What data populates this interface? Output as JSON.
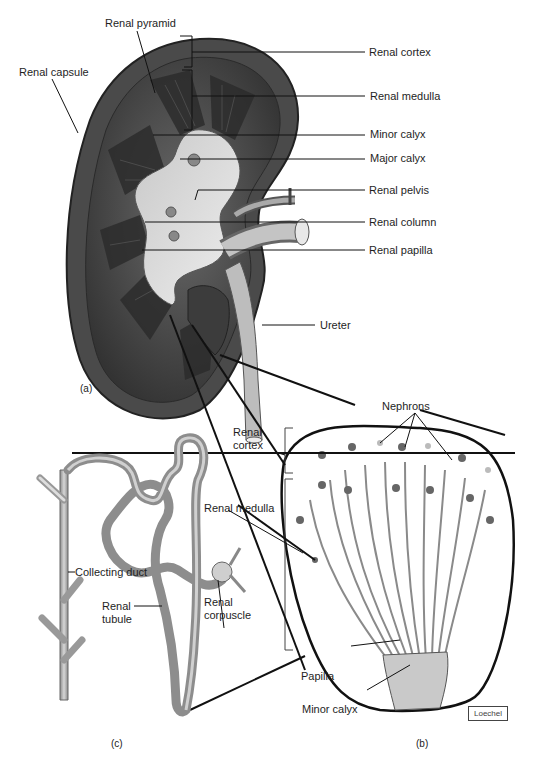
{
  "figure": {
    "panels": {
      "a": "(a)",
      "b": "(b)",
      "c": "(c)"
    },
    "signature": "Loechel"
  },
  "panel_a": {
    "labels": {
      "renal_pyramid": "Renal pyramid",
      "renal_capsule": "Renal capsule",
      "renal_cortex": "Renal cortex",
      "renal_medulla": "Renal medulla",
      "minor_calyx": "Minor calyx",
      "major_calyx": "Major calyx",
      "renal_pelvis": "Renal pelvis",
      "renal_column": "Renal column",
      "renal_papilla": "Renal papilla",
      "ureter": "Ureter"
    }
  },
  "panel_b": {
    "labels": {
      "nephrons": "Nephrons",
      "renal_cortex_line1": "Renal",
      "renal_cortex_line2": "cortex",
      "renal_medulla": "Renal medulla",
      "papilla": "Papilla",
      "minor_calyx": "Minor calyx"
    }
  },
  "panel_c": {
    "labels": {
      "collecting_duct": "Collecting duct",
      "renal_tubule_line1": "Renal",
      "renal_tubule_line2": "tubule",
      "renal_corpuscle_line1": "Renal",
      "renal_corpuscle_line2": "corpuscle"
    }
  },
  "colors": {
    "kidney_dark": "#3a3a3a",
    "kidney_mid": "#5e5e5e",
    "calyx_light": "#e4e4e4",
    "tubule": "#9a9a9a",
    "leader": "#111111"
  }
}
